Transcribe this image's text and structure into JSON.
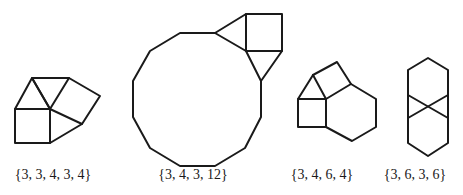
{
  "figures": [
    {
      "label": "{3, 3, 4, 3, 4}",
      "label_x": 53,
      "polylines": [
        [
          [
            32,
            78
          ],
          [
            69,
            78
          ],
          [
            50,
            109
          ],
          [
            32,
            78
          ]
        ],
        [
          [
            15,
            109
          ],
          [
            32,
            78
          ],
          [
            50,
            109
          ],
          [
            15,
            109
          ]
        ],
        [
          [
            15,
            109
          ],
          [
            50,
            109
          ],
          [
            50,
            143
          ],
          [
            15,
            143
          ],
          [
            15,
            109
          ]
        ],
        [
          [
            69,
            78
          ],
          [
            100,
            96
          ],
          [
            82,
            124
          ],
          [
            50,
            109
          ]
        ],
        [
          [
            50,
            143
          ],
          [
            82,
            124
          ]
        ]
      ]
    },
    {
      "label": "{3, 4, 3, 12}",
      "label_x": 193,
      "polylines": [
        [
          [
            215,
            33
          ],
          [
            180,
            33
          ],
          [
            150,
            51
          ],
          [
            133,
            81
          ],
          [
            133,
            117
          ],
          [
            150,
            148
          ],
          [
            180,
            166
          ],
          [
            215,
            166
          ],
          [
            245,
            148
          ],
          [
            261,
            117
          ],
          [
            261,
            81
          ]
        ],
        [
          [
            215,
            33
          ],
          [
            246,
            14
          ],
          [
            246,
            51
          ],
          [
            215,
            33
          ]
        ],
        [
          [
            246,
            14
          ],
          [
            282,
            14
          ],
          [
            282,
            51
          ],
          [
            246,
            51
          ]
        ],
        [
          [
            246,
            51
          ],
          [
            261,
            81
          ],
          [
            282,
            51
          ]
        ]
      ]
    },
    {
      "label": "{3, 4, 6, 4}",
      "label_x": 322,
      "polylines": [
        [
          [
            313,
            75
          ],
          [
            298,
            99
          ],
          [
            326,
            99
          ],
          [
            313,
            75
          ]
        ],
        [
          [
            313,
            75
          ],
          [
            337,
            62
          ],
          [
            351,
            84
          ],
          [
            326,
            99
          ]
        ],
        [
          [
            351,
            84
          ],
          [
            376,
            99
          ],
          [
            376,
            127
          ],
          [
            352,
            141
          ],
          [
            326,
            127
          ],
          [
            326,
            99
          ]
        ],
        [
          [
            298,
            99
          ],
          [
            298,
            127
          ],
          [
            326,
            127
          ]
        ]
      ]
    },
    {
      "label": "{3, 6, 3, 6}",
      "label_x": 415,
      "polylines": [
        [
          [
            408,
            70
          ],
          [
            428,
            58
          ],
          [
            448,
            70
          ],
          [
            448,
            143
          ],
          [
            428,
            156
          ],
          [
            408,
            143
          ],
          [
            408,
            70
          ]
        ],
        [
          [
            408,
            95
          ],
          [
            448,
            118
          ]
        ],
        [
          [
            448,
            95
          ],
          [
            408,
            118
          ]
        ]
      ]
    }
  ],
  "stroke_color": "#1a1a1a"
}
